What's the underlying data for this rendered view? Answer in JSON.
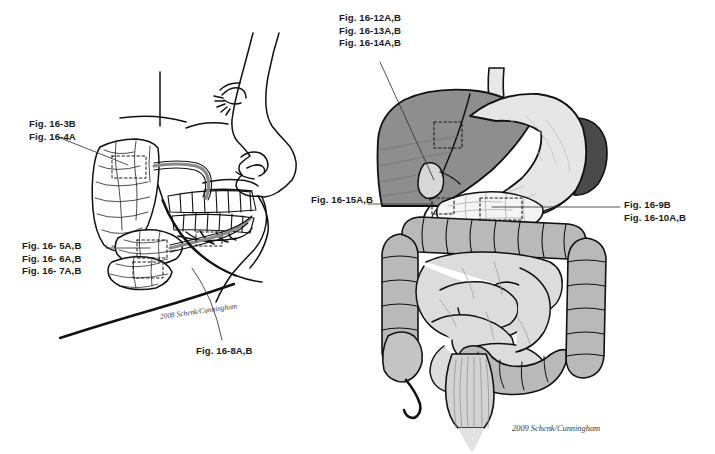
{
  "plate": {
    "title": "Digestive system figure reference plate",
    "background_color": "#ffffff",
    "line_color": "#111111"
  },
  "labels": {
    "parotid": {
      "name": "parotid-gland-callout",
      "lines": [
        "Fig. 16-3B",
        "Fig. 16-4A"
      ]
    },
    "submandibular": {
      "name": "submandibular-sublingual-callout",
      "lines": [
        "Fig. 16- 5A,B",
        "Fig. 16- 6A,B",
        "Fig. 16- 7A,B"
      ]
    },
    "esophagus": {
      "name": "esophagus-callout",
      "lines": [
        "Fig. 16-8A,B"
      ]
    },
    "stomach": {
      "name": "stomach-liver-callout",
      "lines": [
        "Fig. 16-12A,B",
        "Fig. 16-13A,B",
        "Fig. 16-14A,B"
      ]
    },
    "gallbladder": {
      "name": "gallbladder-callout",
      "lines": [
        "Fig. 16-15A,B"
      ]
    },
    "pancreas": {
      "name": "pancreas-intestine-callout",
      "lines": [
        "Fig. 16-9B",
        "Fig. 16-10A,B"
      ]
    }
  },
  "credits": {
    "left": "2008 Schenk/Cunningham",
    "right": "2009 Schenk/Cunningham"
  },
  "figures": {
    "head": {
      "name": "lateral-head-salivary-glands",
      "parts": [
        "face-profile",
        "parotid-gland",
        "parotid-duct",
        "maxillary-teeth",
        "mandibular-teeth",
        "submandibular-gland",
        "sublingual-gland",
        "submandibular-duct",
        "mandible",
        "neck-outline"
      ]
    },
    "abdomen": {
      "name": "abdominal-viscera",
      "parts": [
        "esophagus",
        "liver",
        "stomach",
        "spleen",
        "gallbladder",
        "pancreas",
        "duodenum",
        "transverse-colon",
        "ascending-colon",
        "descending-colon",
        "small-intestine",
        "cecum",
        "appendix",
        "sigmoid-colon",
        "rectum"
      ]
    }
  },
  "markers": {
    "dashed_boxes": [
      {
        "name": "parotid-sample-box"
      },
      {
        "name": "submandibular-sample-box"
      },
      {
        "name": "sublingual-sample-box"
      },
      {
        "name": "liver-sample-box"
      },
      {
        "name": "duodenum-sample-box"
      },
      {
        "name": "pancreas-sample-box"
      }
    ]
  },
  "palette": {
    "liver": "#8e8e8e",
    "stomach": "#e3e3e3",
    "spleen": "#4a4a4a",
    "colon": "#b9b9b9",
    "small_intestine": "#dcdcdc",
    "pancreas": "#f2f2f2",
    "outline": "#111111"
  }
}
